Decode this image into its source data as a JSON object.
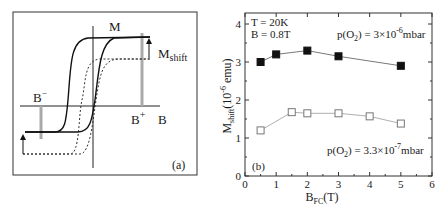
{
  "panel_a": {
    "label": "(a)",
    "axis_x_label": "B",
    "axis_y_label": "M",
    "annotation_shift": "M",
    "annotation_shift_sub": "shift",
    "b_minus": "B",
    "b_minus_sup": "−",
    "b_plus": "B",
    "b_plus_sup": "+"
  },
  "panel_b": {
    "label": "(b)",
    "condition_T": "T = 20K",
    "condition_B": "B = 0.8T",
    "series_high_label_pre": "p(O",
    "series_high_label_sub": "2",
    "series_high_label_post": ") = 3×10",
    "series_high_label_exp": "-6",
    "series_high_label_unit": "mbar",
    "series_low_label_pre": "p(O",
    "series_low_label_sub": "2",
    "series_low_label_post": ") = 3.3×10",
    "series_low_label_exp": "-7",
    "series_low_label_unit": "mbar",
    "ylabel_main": "M",
    "ylabel_sub": "shift",
    "ylabel_unit": "(10",
    "ylabel_exp": "-6",
    "ylabel_unit_end": " emu)",
    "xlabel_main": "B",
    "xlabel_sub": "FC",
    "xlabel_unit": "(T)"
  },
  "chart_data": [
    {
      "type": "diagram",
      "title": "(a)",
      "description": "Schematic hysteresis loops M vs B: solid loop (shifted up) and dashed loop; vertical shift labelled M_shift; grey markers at B- and B+",
      "xlabel": "B",
      "ylabel": "M",
      "annotations": [
        "M_shift",
        "B-",
        "B+",
        "(a)"
      ]
    },
    {
      "type": "line",
      "title": "(b)",
      "xlabel": "B_FC (T)",
      "ylabel": "M_shift (10^-6 emu)",
      "xlim": [
        0,
        6
      ],
      "ylim": [
        0,
        4.3
      ],
      "xticks": [
        0,
        1,
        2,
        3,
        4,
        5,
        6
      ],
      "yticks": [
        0,
        1,
        2,
        3,
        4
      ],
      "grid": false,
      "annotations": [
        "T = 20K",
        "B = 0.8T",
        "(b)"
      ],
      "series": [
        {
          "name": "p(O2) = 3×10^-6 mbar",
          "marker": "filled-square",
          "x": [
            0.5,
            1,
            2,
            3,
            5
          ],
          "values": [
            3.0,
            3.2,
            3.3,
            3.15,
            2.9
          ]
        },
        {
          "name": "p(O2) = 3.3×10^-7 mbar",
          "marker": "open-square",
          "x": [
            0.5,
            1.5,
            2,
            3,
            4,
            5
          ],
          "values": [
            1.2,
            1.68,
            1.65,
            1.65,
            1.57,
            1.38
          ]
        }
      ]
    }
  ]
}
